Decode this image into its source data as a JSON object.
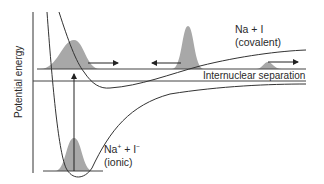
{
  "diagram": {
    "type": "potential-energy-curves",
    "y_axis_label": "Potential energy",
    "x_axis_label": "Internuclear separation",
    "curves": [
      {
        "name": "covalent",
        "label_line1": "Na + I",
        "label_line2": "(covalent)"
      },
      {
        "name": "ionic",
        "label_line1_main": "Na",
        "label_line1_sup1": "+",
        "label_line1_mid": " + I",
        "label_line1_sup2": "−",
        "label_line2": "(ionic)"
      }
    ],
    "wavepackets": [
      {
        "position": "inner-turning-point",
        "direction": "right"
      },
      {
        "position": "crossing-region",
        "direction": "left"
      },
      {
        "position": "dissociating",
        "direction": "right"
      },
      {
        "position": "ionic-ground-state",
        "direction": "none"
      }
    ],
    "excitation_arrow": "up",
    "colors": {
      "line": "#333333",
      "wavepacket_fill": "#a8a8a8",
      "background": "#ffffff"
    }
  }
}
